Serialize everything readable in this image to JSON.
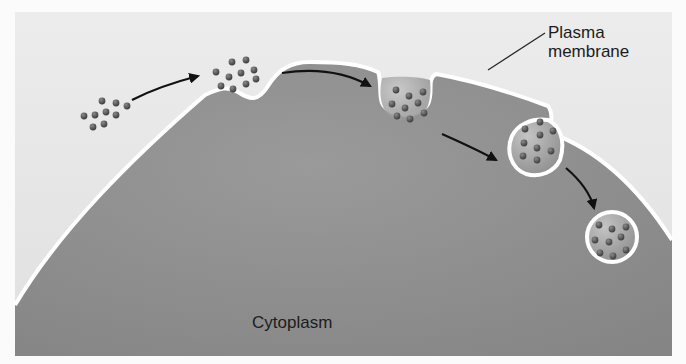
{
  "diagram": {
    "topic": "Endocytosis (pinocytosis) sequence",
    "labels": {
      "membrane_line1": "Plasma",
      "membrane_line2": "membrane",
      "cytoplasm": "Cytoplasm"
    },
    "colors": {
      "page_background": "#fbfbfb",
      "extracellular": "#e6e6e6",
      "cytoplasm": "#8f8f8f",
      "membrane": "#ffffff",
      "particle": "#5a5a5a",
      "vesicle_interior": "#a8a8a8",
      "arrow": "#111111",
      "text": "#1c1c1c"
    },
    "stages": [
      {
        "name": "particles-outside-cell",
        "particle_count": 9
      },
      {
        "name": "particles-at-membrane-dip",
        "particle_count": 10
      },
      {
        "name": "membrane-invagination",
        "particle_count": 9
      },
      {
        "name": "vesicle-pinching-off",
        "particle_count": 9
      },
      {
        "name": "free-vesicle-in-cytoplasm",
        "particle_count": 9
      }
    ],
    "arrows": 4
  }
}
